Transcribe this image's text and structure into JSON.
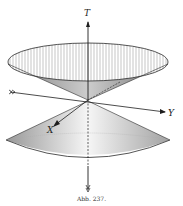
{
  "figure": {
    "caption": "Abb. 237.",
    "axes": {
      "vertical": "T",
      "horizontal_right": "Y",
      "diagonal": "X"
    },
    "colors": {
      "ink": "#2a2a2a",
      "shade": "#9a9a9a",
      "paper": "#ffffff"
    }
  }
}
